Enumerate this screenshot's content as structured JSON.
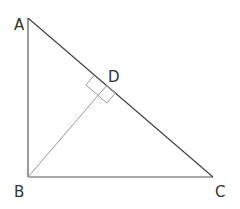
{
  "diagram": {
    "points": {
      "A": {
        "label": "A",
        "x": 28,
        "y": 18
      },
      "B": {
        "label": "B",
        "x": 28,
        "y": 177
      },
      "C": {
        "label": "C",
        "x": 213,
        "y": 177
      },
      "D": {
        "label": "D",
        "x": 106.6,
        "y": 85.6
      }
    },
    "segments": [
      "AB",
      "BC",
      "AC",
      "BD"
    ],
    "right_angle_marks": [
      "BDA",
      "BDC"
    ],
    "colors": {
      "main_line": "#444444",
      "altitude_line": "#888888",
      "label": "#333333"
    }
  }
}
